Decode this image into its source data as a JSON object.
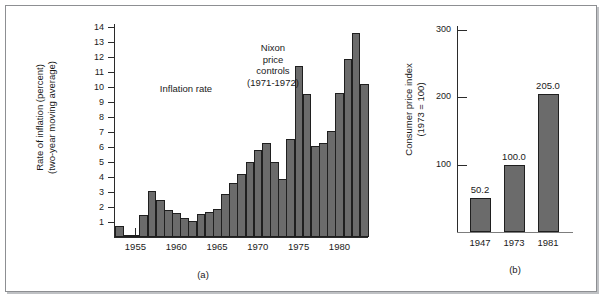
{
  "figure": {
    "background_color": "#ffffff",
    "frame_color": "#8d8f92",
    "bar_fill": "#6b6b6b",
    "bar_stroke": "#1f1f1f",
    "text_color": "#1a1a1a"
  },
  "panel_a": {
    "caption": "(a)",
    "ylabel": "Rate of inflation (percent)\n(two-year moving average)",
    "annotation_series": "Inflation rate",
    "annotation_event": "Nixon\nprice\ncontrols\n(1971-1972)",
    "yticks": [
      1,
      2,
      3,
      4,
      5,
      6,
      7,
      8,
      9,
      10,
      11,
      12,
      13,
      14
    ],
    "xticks": [
      "1955",
      "1960",
      "1965",
      "1970",
      "1975",
      "1980"
    ]
  },
  "panel_b": {
    "caption": "(b)",
    "ylabel": "Consumer price index\n(1973 = 100)",
    "yticks": [
      100,
      200,
      300
    ],
    "xticks": [
      "1947",
      "1973",
      "1981"
    ],
    "datalabels": [
      "50.2",
      "100.0",
      "205.0"
    ]
  },
  "chart_data": [
    {
      "type": "bar",
      "id": "panel-a",
      "title": "",
      "subtitle": "(a)",
      "xlabel": "",
      "ylabel": "Rate of inflation (percent) (two-year moving average)",
      "ylim": [
        0,
        14
      ],
      "xlim": [
        1952,
        1982
      ],
      "grid": false,
      "legend": "none",
      "ytick_values": [
        1,
        2,
        3,
        4,
        5,
        6,
        7,
        8,
        9,
        10,
        11,
        12,
        13,
        14
      ],
      "xtick_values": [
        1955,
        1960,
        1965,
        1970,
        1975,
        1980
      ],
      "annotations": [
        {
          "text": "Inflation rate",
          "x": 1962.5,
          "y": 8.0
        },
        {
          "text": "Nixon price controls (1971-1972)",
          "x": 1971.5,
          "y": 11.3
        }
      ],
      "categories": [
        1953,
        1954,
        1955,
        1956,
        1957,
        1958,
        1959,
        1960,
        1961,
        1962,
        1963,
        1964,
        1965,
        1966,
        1967,
        1968,
        1969,
        1970,
        1971,
        1972,
        1973,
        1974,
        1975,
        1976,
        1977,
        1978,
        1979,
        1980,
        1981
      ],
      "values": [
        0.75,
        0.15,
        0.15,
        1.5,
        3.1,
        2.5,
        1.8,
        1.6,
        1.25,
        1.1,
        1.55,
        1.65,
        1.85,
        2.9,
        3.6,
        4.2,
        5.0,
        5.8,
        6.25,
        5.0,
        3.9,
        6.55,
        11.4,
        9.55,
        6.1,
        6.3,
        7.1,
        9.6,
        11.9,
        13.6,
        10.2
      ]
    },
    {
      "type": "bar",
      "id": "panel-b",
      "title": "",
      "subtitle": "(b)",
      "xlabel": "",
      "ylabel": "Consumer price index (1973 = 100)",
      "ylim": [
        0,
        300
      ],
      "grid": false,
      "legend": "none",
      "ytick_values": [
        100,
        200,
        300
      ],
      "categories": [
        "1947",
        "1973",
        "1981"
      ],
      "values": [
        50.2,
        100.0,
        205.0
      ],
      "datalabels": [
        "50.2",
        "100.0",
        "205.0"
      ]
    }
  ]
}
